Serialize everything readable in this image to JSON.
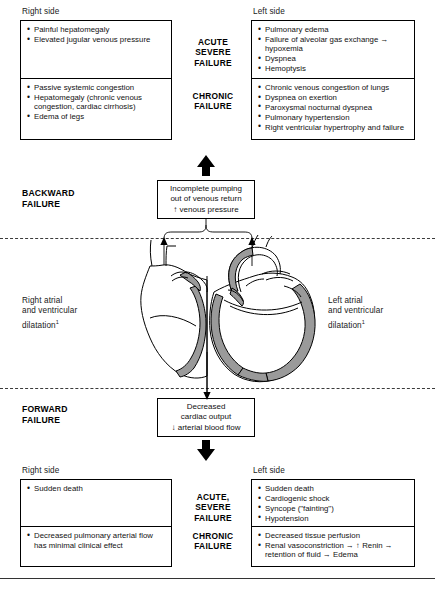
{
  "diagram": {
    "column_headers": {
      "right": "Right side",
      "left": "Left side"
    },
    "severity": {
      "acute": "ACUTE\nSEVERE\nFAILURE",
      "acute_forward": "ACUTE,\nSEVERE\nFAILURE",
      "chronic": "CHRONIC\nFAILURE"
    },
    "modes": {
      "backward": "BACKWARD\nFAILURE",
      "forward": "FORWARD\nFAILURE"
    },
    "backward": {
      "right_acute": [
        "Painful hepatomegaly",
        "Elevated jugular venous pressure"
      ],
      "right_chronic": [
        "Passive systemic congestion",
        "Hepatomegaly (chronic venous congestion, cardiac cirrhosis)",
        "Edema of legs"
      ],
      "left_acute": [
        "Pulmonary edema",
        "Failure of alveolar gas exchange → hypoxemia",
        "Dyspnea",
        "Hemoptysis"
      ],
      "left_chronic": [
        "Chronic venous congestion of lungs",
        "Dyspnea on exertion",
        "Paroxysmal nocturnal dyspnea",
        "Pulmonary hypertension",
        "Right ventricular hypertrophy and failure"
      ],
      "flow_box": [
        "Incomplete pumping",
        "out of venous return",
        "↑ venous pressure"
      ]
    },
    "forward": {
      "right_acute": [
        "Sudden death"
      ],
      "right_chronic": [
        "Decreased pulmonary arterial flow has minimal clinical effect"
      ],
      "left_acute": [
        "Sudden death",
        "Cardiogenic shock",
        "Syncope (\"fainting\")",
        "Hypotension"
      ],
      "left_chronic": [
        "Decreased tissue perfusion",
        "Renal vasoconstriction → ↑ Renin → retention of fluid → Edema"
      ],
      "flow_box": [
        "Decreased",
        "cardiac output",
        "↓ arterial blood flow"
      ]
    },
    "heart": {
      "right_caption": [
        "Right atrial",
        "and ventricular",
        "dilatation"
      ],
      "left_caption": [
        "Left atrial",
        "and ventricular",
        "dilatation"
      ],
      "caption_superscript": "1",
      "chambers": {
        "ra": "RA",
        "rv": "RV",
        "la": "LA",
        "lv": "LV"
      }
    },
    "colors": {
      "ink": "#000000",
      "myocardium": "#9a9a9a",
      "cavity": "#ffffff",
      "dashed_rule": "#3b3b3b"
    }
  }
}
